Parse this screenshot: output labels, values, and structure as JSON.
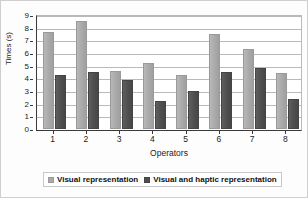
{
  "chart_data": {
    "type": "bar",
    "title": "",
    "xlabel": "Operators",
    "ylabel": "Times (s)",
    "categories": [
      "1",
      "2",
      "3",
      "4",
      "5",
      "6",
      "7",
      "8"
    ],
    "series": [
      {
        "name": "Visual representation",
        "color": "#a9a9a9",
        "values": [
          7.65,
          8.55,
          4.6,
          5.25,
          4.25,
          7.5,
          6.3,
          4.4
        ]
      },
      {
        "name": "Visual and haptic representation",
        "color": "#4f4f4f",
        "values": [
          4.3,
          4.5,
          3.9,
          2.25,
          3.0,
          4.5,
          4.8,
          2.4
        ]
      }
    ],
    "ylim": [
      0,
      9
    ],
    "ytick_labels": [
      "0",
      "1",
      "2",
      "3",
      "4",
      "5",
      "6",
      "7",
      "8",
      "9"
    ],
    "grid": true,
    "legend_position": "bottom"
  }
}
